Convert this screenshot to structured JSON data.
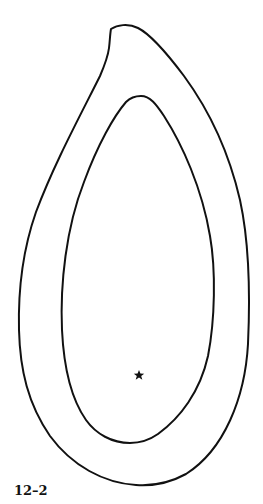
{
  "figure": {
    "label": "12–2",
    "colors": {
      "background": "#ffffff",
      "stroke": "#111111"
    },
    "shapes": [
      {
        "name": "outer-contour",
        "type": "closed-curve",
        "notch": "top-left"
      },
      {
        "name": "inner-contour",
        "type": "closed-curve"
      }
    ],
    "marker": {
      "name": "star-marker",
      "symbol": "★",
      "position": {
        "x": 139,
        "y": 375
      }
    }
  }
}
